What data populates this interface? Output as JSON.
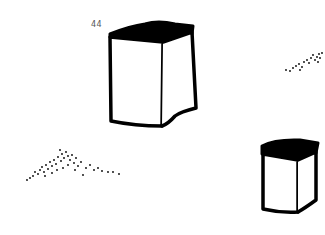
{
  "figure": {
    "item_number": "44",
    "objects": [
      {
        "name": "large-box",
        "description": "tall box with dark top face"
      },
      {
        "name": "small-box",
        "description": "small box with dark top face"
      },
      {
        "name": "dot-cluster-left",
        "description": "triangular scatter of dots"
      },
      {
        "name": "dot-cluster-right",
        "description": "small scatter of dots"
      }
    ],
    "colors": {
      "ink": "#000000",
      "background": "#ffffff"
    }
  }
}
